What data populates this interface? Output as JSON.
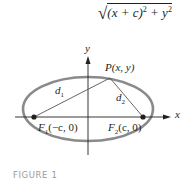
{
  "formula": {
    "radical": "√",
    "expr_open": "(x + c)",
    "exp": "2",
    "plus": " + y",
    "exp2": "2"
  },
  "figure": {
    "axis_x_label": "x",
    "axis_y_label": "y",
    "point_label": "P(x, y)",
    "d1": "d",
    "d1_sub": "1",
    "d2": "d",
    "d2_sub": "2",
    "focus1": {
      "name": "F",
      "sub": "1",
      "coords": "(−c, 0)"
    },
    "focus2": {
      "name": "F",
      "sub": "2",
      "coords": "(c, 0)"
    },
    "colors": {
      "ellipse": "#8a8a8a",
      "axes": "#231f20",
      "lines": "#555555"
    }
  },
  "caption": "FIGURE 1"
}
